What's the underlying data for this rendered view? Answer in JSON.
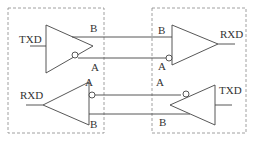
{
  "diagram": {
    "left_node": {
      "driver": {
        "input_label": "TXD",
        "out_pos_label": "B",
        "out_neg_label": "A"
      },
      "receiver": {
        "output_label": "RXD",
        "in_neg_label": "A",
        "in_pos_label": "B"
      }
    },
    "right_node": {
      "receiver": {
        "output_label": "RXD",
        "in_pos_label": "B",
        "in_neg_label": "A"
      },
      "driver": {
        "input_label": "TXD",
        "out_neg_label": "A",
        "out_pos_label": "B"
      }
    },
    "colors": {
      "line": "#444444",
      "dashed_box": "#888888"
    }
  }
}
